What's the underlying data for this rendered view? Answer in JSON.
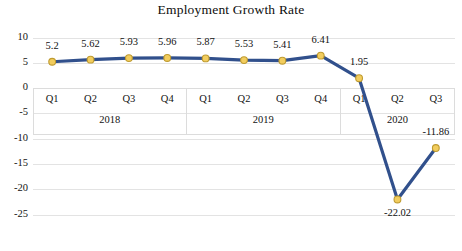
{
  "chart_data": {
    "type": "line",
    "title": "Employment Growth Rate",
    "xlabel": "",
    "ylabel": "",
    "categories": [
      "Q1",
      "Q2",
      "Q3",
      "Q4",
      "Q1",
      "Q2",
      "Q3",
      "Q4",
      "Q1",
      "Q2",
      "Q3"
    ],
    "group_labels": [
      "2018",
      "2019",
      "2020"
    ],
    "group_sizes": [
      4,
      4,
      3
    ],
    "values": [
      5.2,
      5.62,
      5.93,
      5.96,
      5.87,
      5.53,
      5.41,
      6.41,
      1.95,
      -22.02,
      -11.86
    ],
    "data_labels": [
      "5.2",
      "5.62",
      "5.93",
      "5.96",
      "5.87",
      "5.53",
      "5.41",
      "6.41",
      "1.95",
      "-22.02",
      "-11.86"
    ],
    "ylim": [
      -25,
      10
    ],
    "ytick_values": [
      10,
      5,
      0,
      -5,
      -10,
      -15,
      -20,
      -25
    ],
    "ytick_labels": [
      "10",
      "5",
      "0",
      "-5",
      "-10",
      "-15",
      "-20",
      "-25"
    ],
    "grid": true,
    "legend": false,
    "series": [
      {
        "name": "Employment Growth Rate",
        "values": [
          5.2,
          5.62,
          5.93,
          5.96,
          5.87,
          5.53,
          5.41,
          6.41,
          1.95,
          -22.02,
          -11.86
        ]
      }
    ],
    "colors": {
      "line": "#31508C",
      "marker_fill": "#F2CD5E",
      "marker_stroke": "#BF9B30",
      "gridline": "#E3E3E3",
      "axis_text": "#121212",
      "title_text": "#0D0D0D",
      "background": "#FFFFFF"
    }
  }
}
